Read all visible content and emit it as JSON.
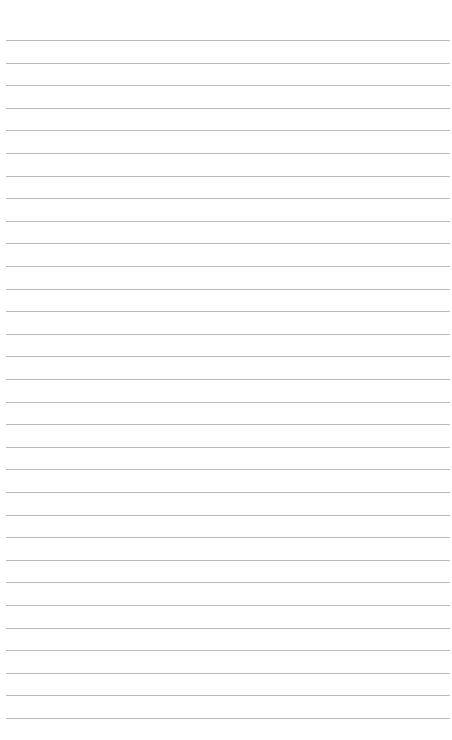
{
  "page": {
    "type": "lined-paper",
    "background_color": "#ffffff",
    "rule_color": "#b9b9b9",
    "rule_count": 31,
    "first_rule_y": 40,
    "rule_spacing": 22.6,
    "rule_left": 6,
    "rule_width": 444
  }
}
